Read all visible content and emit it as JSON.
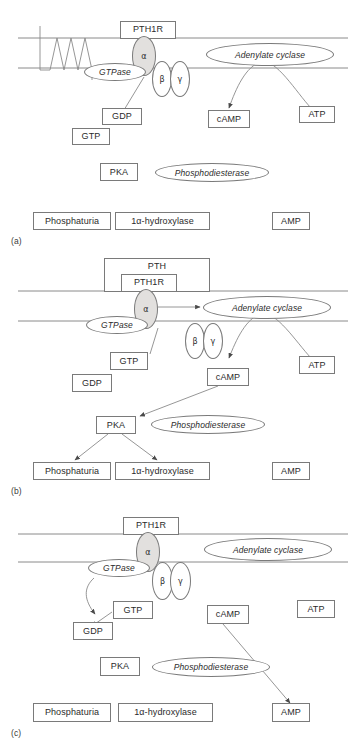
{
  "figure": {
    "type": "biological-signaling-diagram"
  },
  "panels": [
    {
      "id": "a",
      "label": "(a)",
      "nodes": {
        "receptor": "PTH1R",
        "alpha": "α",
        "beta": "β",
        "gamma": "γ",
        "gtpase": "GTPase",
        "gdp": "GDP",
        "gtp": "GTP",
        "adenylate_cyclase": "Adenylate cyclase",
        "atp": "ATP",
        "camp": "cAMP",
        "pka": "PKA",
        "phosphodiesterase": "Phosphodiesterase",
        "phosphaturia": "Phosphaturia",
        "hydroxylase": "1α-hydroxylase",
        "amp": "AMP"
      }
    },
    {
      "id": "b",
      "label": "(b)",
      "nodes": {
        "ligand": "PTH",
        "receptor": "PTH1R",
        "alpha": "α",
        "beta": "β",
        "gamma": "γ",
        "gtpase": "GTPase",
        "gdp": "GDP",
        "gtp": "GTP",
        "adenylate_cyclase": "Adenylate cyclase",
        "atp": "ATP",
        "camp": "cAMP",
        "pka": "PKA",
        "phosphodiesterase": "Phosphodiesterase",
        "phosphaturia": "Phosphaturia",
        "hydroxylase": "1α-hydroxylase",
        "amp": "AMP"
      }
    },
    {
      "id": "c",
      "label": "(c)",
      "nodes": {
        "receptor": "PTH1R",
        "alpha": "α",
        "beta": "β",
        "gamma": "γ",
        "gtpase": "GTPase",
        "gdp": "GDP",
        "gtp": "GTP",
        "adenylate_cyclase": "Adenylate cyclase",
        "atp": "ATP",
        "camp": "cAMP",
        "pka": "PKA",
        "phosphodiesterase": "Phosphodiesterase",
        "phosphaturia": "Phosphaturia",
        "hydroxylase": "1α-hydroxylase",
        "amp": "AMP"
      }
    }
  ],
  "colors": {
    "stroke": "#7a7a7a",
    "text": "#2b2b2b",
    "alpha_fill": "#e2e0de",
    "background": "#ffffff"
  }
}
